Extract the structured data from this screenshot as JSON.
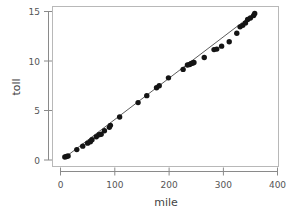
{
  "chart_data": {
    "type": "scatter",
    "title": "",
    "subtitle": "",
    "xlabel": "mile",
    "ylabel": "toll",
    "xlim": [
      -8,
      412
    ],
    "ylim": [
      -0.6,
      15.6
    ],
    "xticks": [
      0,
      100,
      200,
      300,
      400
    ],
    "xtick_labels": [
      "0",
      "100",
      "200",
      "300",
      "400"
    ],
    "yticks": [
      0,
      5,
      10,
      15
    ],
    "ytick_labels": [
      "0",
      "5",
      "10",
      "15"
    ],
    "grid": false,
    "legend": null,
    "point_marker": "filled-circle",
    "point_color": "#141414",
    "line_color": "#4a4a4a",
    "series": [
      {
        "name": "toll vs mile",
        "x": [
          8,
          11,
          14,
          30,
          41,
          50,
          55,
          58,
          66,
          71,
          75,
          81,
          90,
          92,
          109,
          143,
          159,
          177,
          182,
          199,
          226,
          234,
          238,
          241,
          244,
          246,
          265,
          283,
          288,
          297,
          311,
          325,
          331,
          336,
          341,
          345,
          350,
          356,
          358
        ],
        "y": [
          0.3,
          0.35,
          0.4,
          1.05,
          1.4,
          1.7,
          1.85,
          2.05,
          2.35,
          2.55,
          2.6,
          2.95,
          3.3,
          3.5,
          4.35,
          5.8,
          6.5,
          7.3,
          7.5,
          8.3,
          9.15,
          9.6,
          9.65,
          9.75,
          9.8,
          9.85,
          10.35,
          11.15,
          11.2,
          11.5,
          11.95,
          12.8,
          13.45,
          13.6,
          13.85,
          14.2,
          14.35,
          14.6,
          14.8
        ]
      }
    ],
    "fit_line": {
      "name": "fitted-line",
      "x": [
        8,
        358
      ],
      "y": [
        0.25,
        14.85
      ]
    }
  },
  "axes": {
    "x_axis_name": "mile-axis",
    "y_axis_name": "toll-axis"
  }
}
